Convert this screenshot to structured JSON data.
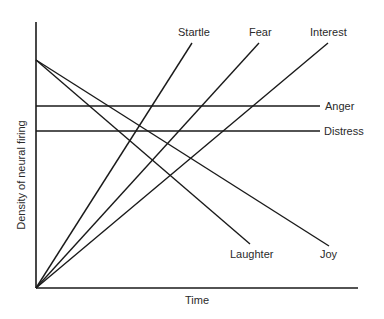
{
  "chart_data": {
    "type": "line",
    "title": "",
    "xlabel": "Time",
    "ylabel": "Density of neural firing",
    "grid": false,
    "legend": "inline labels at line ends",
    "note": "Conceptual diagram: gradient of neural firing density over time for different emotions (relative units; axes unscaled)",
    "x_range": [
      0,
      1
    ],
    "y_range": [
      0,
      1
    ],
    "series": [
      {
        "name": "Startle",
        "x": [
          0,
          0.485
        ],
        "y": [
          0,
          0.94
        ],
        "pattern": "steep increase"
      },
      {
        "name": "Fear",
        "x": [
          0,
          0.693
        ],
        "y": [
          0,
          0.94
        ],
        "pattern": "moderate increase"
      },
      {
        "name": "Interest",
        "x": [
          0,
          0.907
        ],
        "y": [
          0,
          0.94
        ],
        "pattern": "gradual increase"
      },
      {
        "name": "Anger",
        "x": [
          0,
          0.885
        ],
        "y": [
          0.686,
          0.686
        ],
        "pattern": "sustained high level"
      },
      {
        "name": "Distress",
        "x": [
          0,
          0.885
        ],
        "y": [
          0.575,
          0.575
        ],
        "pattern": "sustained moderate level"
      },
      {
        "name": "Laughter",
        "x": [
          0,
          0.665
        ],
        "y": [
          0.805,
          0.195
        ],
        "pattern": "steep decrease"
      },
      {
        "name": "Joy",
        "x": [
          0,
          0.91
        ],
        "y": [
          0.805,
          0.186
        ],
        "pattern": "gradual decrease"
      }
    ]
  },
  "axes": {
    "x_label": "Time",
    "y_label": "Density of neural firing"
  },
  "px": {
    "origin": [
      36,
      288
    ],
    "y_top": 22,
    "x_end": 358,
    "lines": [
      {
        "name": "Startle",
        "x1": 36,
        "y1": 288,
        "x2": 192,
        "y2": 43
      },
      {
        "name": "Fear",
        "x1": 36,
        "y1": 288,
        "x2": 259,
        "y2": 43
      },
      {
        "name": "Interest",
        "x1": 36,
        "y1": 288,
        "x2": 328,
        "y2": 43
      },
      {
        "name": "Anger",
        "x1": 36,
        "y1": 106,
        "x2": 320,
        "y2": 106
      },
      {
        "name": "Distress",
        "x1": 36,
        "y1": 131,
        "x2": 320,
        "y2": 131
      },
      {
        "name": "Laughter",
        "x1": 36,
        "y1": 60,
        "x2": 250,
        "y2": 244
      },
      {
        "name": "Joy",
        "x1": 36,
        "y1": 60,
        "x2": 329,
        "y2": 246
      }
    ],
    "labels": [
      {
        "name": "Startle",
        "x": 178,
        "y": 36,
        "anchor": "start"
      },
      {
        "name": "Fear",
        "x": 249,
        "y": 36,
        "anchor": "start"
      },
      {
        "name": "Interest",
        "x": 310,
        "y": 36,
        "anchor": "start"
      },
      {
        "name": "Anger",
        "x": 325,
        "y": 110,
        "anchor": "start"
      },
      {
        "name": "Distress",
        "x": 324,
        "y": 135,
        "anchor": "start"
      },
      {
        "name": "Laughter",
        "x": 230,
        "y": 258,
        "anchor": "start"
      },
      {
        "name": "Joy",
        "x": 320,
        "y": 258,
        "anchor": "start"
      }
    ]
  },
  "colors": {
    "line": "#1a1a1a",
    "text": "#2a2a2a",
    "background": "#ffffff"
  }
}
